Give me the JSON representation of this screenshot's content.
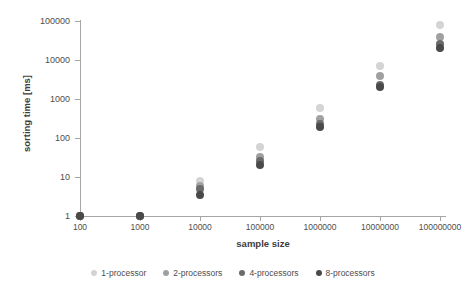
{
  "chart_data": {
    "type": "scatter",
    "title": "",
    "xlabel": "sample size",
    "ylabel": "sorting time [ms]",
    "xscale": "log",
    "yscale": "log",
    "xlim": [
      100,
      100000000
    ],
    "ylim": [
      1,
      100000
    ],
    "grid": false,
    "legend_position": "bottom",
    "x_tick_labels": [
      "100",
      "1000",
      "10000",
      "100000",
      "1000000",
      "10000000",
      "100000000"
    ],
    "y_tick_labels": [
      "1",
      "10",
      "100",
      "1000",
      "10000",
      "100000"
    ],
    "x": [
      100,
      1000,
      10000,
      100000,
      1000000,
      10000000,
      100000000
    ],
    "series": [
      {
        "name": "1-processor",
        "color": "#d4d4d4",
        "values": [
          1,
          1,
          8,
          60,
          600,
          7000,
          80000
        ]
      },
      {
        "name": "2-processors",
        "color": "#a0a0a0",
        "values": [
          1,
          1,
          6,
          32,
          310,
          4000,
          40000
        ]
      },
      {
        "name": "4-processors",
        "color": "#6b6b6b",
        "values": [
          1,
          1,
          5,
          25,
          230,
          2300,
          26000
        ]
      },
      {
        "name": "8-processors",
        "color": "#4a4a4a",
        "values": [
          1,
          1,
          3.5,
          20,
          195,
          2000,
          20000
        ]
      }
    ]
  },
  "legend": {
    "items": [
      {
        "label": "1-processor",
        "color": "#d4d4d4"
      },
      {
        "label": "2-processors",
        "color": "#a0a0a0"
      },
      {
        "label": "4-processors",
        "color": "#6b6b6b"
      },
      {
        "label": "8-processors",
        "color": "#4a4a4a"
      }
    ]
  },
  "axes": {
    "x_title": "sample size",
    "y_title": "sorting time [ms]"
  }
}
